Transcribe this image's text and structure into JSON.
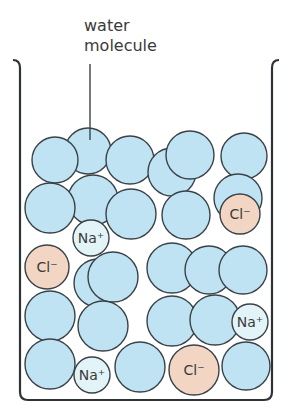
{
  "label": {
    "line1": "water",
    "line2": "molecule"
  },
  "colors": {
    "water": "#bfe3f3",
    "sodium": "#e3f4f9",
    "chloride": "#f2d6c3",
    "outline": "#3a4248"
  },
  "water_molecules": [
    [
      88,
      151,
      23
    ],
    [
      55,
      160,
      23
    ],
    [
      130,
      160,
      24
    ],
    [
      172,
      172,
      24
    ],
    [
      190,
      155,
      24
    ],
    [
      244,
      156,
      23
    ],
    [
      238,
      198,
      24
    ],
    [
      93,
      200,
      25
    ],
    [
      50,
      208,
      25
    ],
    [
      131,
      214,
      25
    ],
    [
      186,
      215,
      24
    ],
    [
      98,
      283,
      24
    ],
    [
      113,
      277,
      25
    ],
    [
      172,
      268,
      25
    ],
    [
      209,
      270,
      24
    ],
    [
      243,
      270,
      24
    ],
    [
      50,
      316,
      25
    ],
    [
      103,
      326,
      25
    ],
    [
      172,
      321,
      25
    ],
    [
      215,
      320,
      25
    ],
    [
      50,
      364,
      25
    ],
    [
      140,
      367,
      25
    ],
    [
      246,
      366,
      24
    ]
  ],
  "ions": [
    {
      "type": "sodium",
      "label": "Na⁺",
      "cx": 91,
      "cy": 238,
      "r": 18
    },
    {
      "type": "chloride",
      "label": "Cl⁻",
      "cx": 240,
      "cy": 214,
      "r": 20
    },
    {
      "type": "chloride",
      "label": "Cl⁻",
      "cx": 47,
      "cy": 267,
      "r": 22
    },
    {
      "type": "sodium",
      "label": "Na⁺",
      "cx": 250,
      "cy": 322,
      "r": 18
    },
    {
      "type": "sodium",
      "label": "Na⁺",
      "cx": 92,
      "cy": 375,
      "r": 18
    },
    {
      "type": "chloride",
      "label": "Cl⁻",
      "cx": 194,
      "cy": 370,
      "r": 25
    }
  ]
}
